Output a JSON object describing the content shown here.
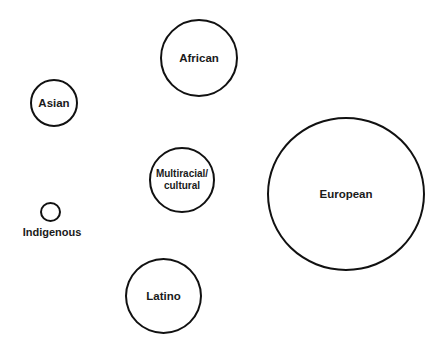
{
  "diagram": {
    "type": "bubble-diagram",
    "stroke_color": "#111111",
    "background": "#ffffff",
    "bubbles": [
      {
        "id": "african",
        "label": "African",
        "cx": 199,
        "cy": 58,
        "r": 39,
        "label_position": "inside"
      },
      {
        "id": "asian",
        "label": "Asian",
        "cx": 54,
        "cy": 103,
        "r": 24,
        "label_position": "inside"
      },
      {
        "id": "multiracial",
        "label": "Multiracial/\ncultural",
        "cx": 182,
        "cy": 180,
        "r": 33,
        "label_position": "inside"
      },
      {
        "id": "indigenous",
        "label": "Indigenous",
        "cx": 50,
        "cy": 212,
        "r": 10,
        "label_position": "below"
      },
      {
        "id": "latino",
        "label": "Latino",
        "cx": 163,
        "cy": 296,
        "r": 38,
        "label_position": "inside"
      },
      {
        "id": "european",
        "label": "European",
        "cx": 346,
        "cy": 194,
        "r": 78,
        "label_position": "inside"
      }
    ]
  }
}
